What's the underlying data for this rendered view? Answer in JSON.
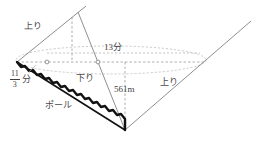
{
  "diagram": {
    "colors": {
      "background": "#ffffff",
      "solid_line": "#8c8c8c",
      "dashed_line": "#9a9a9a",
      "pole_line": "#1a1a1a",
      "text": "#4a4a4a"
    },
    "labels": {
      "nobori_left": "上り",
      "nobori_right": "上り",
      "kudari": "下り",
      "distance_top": "13分",
      "height": "561m",
      "pole": "ポール",
      "fraction_numerator": "11",
      "fraction_denominator": "3",
      "fraction_unit": "分"
    },
    "points": {
      "left_vertex": "17,62",
      "apex": "72,17",
      "bottom_vertex": "125,130",
      "right_top": "250,22",
      "dashed_right_end": "205,62",
      "marker_1": "47,62",
      "marker_2": "98,62"
    }
  }
}
